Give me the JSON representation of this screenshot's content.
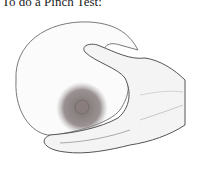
{
  "caption": "To do a Pinch Test:",
  "figure": {
    "colors": {
      "outline": "#555555",
      "shading": "#9a9a9a",
      "areola": "#8a7f7f",
      "background": "#ffffff"
    }
  }
}
